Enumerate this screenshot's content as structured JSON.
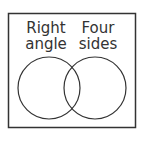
{
  "diagram": {
    "type": "venn",
    "sets": [
      {
        "label_line1": "Right",
        "label_line2": "angle"
      },
      {
        "label_line1": "Four",
        "label_line2": "sides"
      }
    ],
    "colors": {
      "stroke": "#333333",
      "background": "#ffffff"
    }
  }
}
